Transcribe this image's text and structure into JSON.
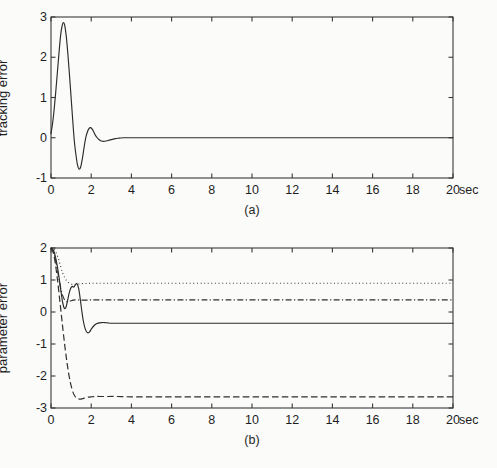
{
  "figure": {
    "background_color": "#fbfbfa",
    "ink_color": "#2b2b2b"
  },
  "chart_data": [
    {
      "type": "line",
      "panel": "a",
      "caption": "(a)",
      "title": "",
      "xlabel": "",
      "ylabel": "tracking error",
      "x_unit": "sec",
      "xlim": [
        0,
        20
      ],
      "ylim": [
        -1,
        3
      ],
      "xticks": [
        0,
        2,
        4,
        6,
        8,
        10,
        12,
        14,
        16,
        18,
        20
      ],
      "xtick_labels": [
        "0",
        "2",
        "4",
        "6",
        "8",
        "10",
        "12",
        "14",
        "16",
        "18",
        "20"
      ],
      "yticks": [
        -1,
        0,
        1,
        2,
        3
      ],
      "ytick_labels": [
        "-1",
        "0",
        "1",
        "2",
        "3"
      ],
      "grid": false,
      "legend": false,
      "box": true,
      "series": [
        {
          "name": "tracking error",
          "style": "solid",
          "x": [
            0.0,
            0.08,
            0.16,
            0.24,
            0.32,
            0.4,
            0.48,
            0.56,
            0.62,
            0.68,
            0.76,
            0.84,
            0.92,
            1.0,
            1.08,
            1.16,
            1.24,
            1.32,
            1.4,
            1.48,
            1.56,
            1.64,
            1.72,
            1.8,
            1.88,
            1.96,
            2.04,
            2.12,
            2.2,
            2.3,
            2.4,
            2.5,
            2.62,
            2.75,
            2.9,
            3.05,
            3.2,
            3.4,
            3.6,
            3.9,
            4.3,
            5.0,
            6.0,
            8.0,
            10.0,
            13.0,
            16.0,
            20.0
          ],
          "y": [
            0.1,
            0.36,
            0.72,
            1.16,
            1.64,
            2.12,
            2.55,
            2.8,
            2.86,
            2.8,
            2.52,
            2.08,
            1.56,
            1.0,
            0.44,
            -0.08,
            -0.42,
            -0.68,
            -0.78,
            -0.72,
            -0.52,
            -0.26,
            -0.02,
            0.13,
            0.22,
            0.25,
            0.22,
            0.15,
            0.07,
            0.0,
            -0.05,
            -0.08,
            -0.09,
            -0.08,
            -0.06,
            -0.04,
            -0.02,
            -0.01,
            0.0,
            0.0,
            0.0,
            0.0,
            0.0,
            0.0,
            0.0,
            0.0,
            0.0,
            0.0
          ]
        }
      ]
    },
    {
      "type": "line",
      "panel": "b",
      "caption": "(b)",
      "title": "",
      "xlabel": "",
      "ylabel": "parameter error",
      "x_unit": "sec",
      "xlim": [
        0,
        20
      ],
      "ylim": [
        -3,
        2
      ],
      "xticks": [
        0,
        2,
        4,
        6,
        8,
        10,
        12,
        14,
        16,
        18,
        20
      ],
      "xtick_labels": [
        "0",
        "2",
        "4",
        "6",
        "8",
        "10",
        "12",
        "14",
        "16",
        "18",
        "20"
      ],
      "yticks": [
        -3,
        -2,
        -1,
        0,
        1,
        2
      ],
      "ytick_labels": [
        "-3",
        "-2",
        "-1",
        "0",
        "1",
        "2"
      ],
      "grid": false,
      "legend": false,
      "box": true,
      "series": [
        {
          "name": "parameter error 1",
          "style": "solid",
          "final_value": -0.35,
          "x": [
            0.0,
            0.1,
            0.2,
            0.3,
            0.4,
            0.5,
            0.58,
            0.66,
            0.74,
            0.82,
            0.9,
            0.98,
            1.06,
            1.14,
            1.22,
            1.3,
            1.38,
            1.46,
            1.54,
            1.62,
            1.72,
            1.82,
            1.92,
            2.02,
            2.14,
            2.26,
            2.38,
            2.52,
            2.66,
            2.82,
            3.0,
            3.2,
            3.5,
            4.0,
            5.0,
            6.5,
            8.0,
            10.0,
            13.0,
            16.0,
            20.0
          ],
          "y": [
            2.0,
            1.95,
            1.78,
            1.48,
            1.08,
            0.62,
            0.3,
            0.12,
            0.14,
            0.34,
            0.58,
            0.74,
            0.8,
            0.78,
            0.86,
            0.88,
            0.72,
            0.38,
            0.0,
            -0.32,
            -0.56,
            -0.65,
            -0.62,
            -0.52,
            -0.43,
            -0.37,
            -0.34,
            -0.33,
            -0.33,
            -0.34,
            -0.35,
            -0.35,
            -0.35,
            -0.35,
            -0.35,
            -0.35,
            -0.35,
            -0.35,
            -0.35,
            -0.35,
            -0.35
          ]
        },
        {
          "name": "parameter error 2",
          "style": "dotted",
          "final_value": 0.9,
          "x": [
            0.0,
            0.12,
            0.24,
            0.36,
            0.48,
            0.58,
            0.68,
            0.78,
            0.88,
            0.98,
            1.08,
            1.18,
            1.3,
            1.45,
            1.6,
            1.8,
            2.0,
            2.3,
            2.7,
            3.2,
            4.0,
            5.5,
            7.5,
            10.0,
            13.0,
            16.0,
            20.0
          ],
          "y": [
            2.0,
            1.98,
            1.88,
            1.68,
            1.42,
            1.22,
            1.08,
            0.98,
            0.92,
            0.88,
            0.86,
            0.86,
            0.87,
            0.88,
            0.89,
            0.89,
            0.9,
            0.9,
            0.9,
            0.9,
            0.9,
            0.9,
            0.9,
            0.9,
            0.9,
            0.9,
            0.9
          ]
        },
        {
          "name": "parameter error 3",
          "style": "dashdot",
          "final_value": 0.38,
          "x": [
            0.0,
            0.1,
            0.2,
            0.3,
            0.4,
            0.5,
            0.6,
            0.7,
            0.8,
            0.9,
            1.0,
            1.1,
            1.2,
            1.32,
            1.45,
            1.6,
            1.8,
            2.0,
            2.3,
            2.7,
            3.2,
            4.0,
            5.5,
            7.5,
            10.0,
            13.0,
            16.0,
            20.0
          ],
          "y": [
            2.0,
            1.92,
            1.7,
            1.38,
            1.02,
            0.7,
            0.48,
            0.36,
            0.32,
            0.33,
            0.35,
            0.37,
            0.38,
            0.38,
            0.37,
            0.37,
            0.37,
            0.38,
            0.38,
            0.38,
            0.38,
            0.38,
            0.38,
            0.38,
            0.38,
            0.38,
            0.38,
            0.38
          ]
        },
        {
          "name": "parameter error 4",
          "style": "dashed",
          "final_value": -2.65,
          "x": [
            0.0,
            0.1,
            0.2,
            0.3,
            0.4,
            0.5,
            0.6,
            0.7,
            0.8,
            0.9,
            1.0,
            1.1,
            1.2,
            1.3,
            1.4,
            1.5,
            1.62,
            1.74,
            1.86,
            2.0,
            2.2,
            2.45,
            2.8,
            3.3,
            4.0,
            5.5,
            7.5,
            10.0,
            13.0,
            16.0,
            20.0
          ],
          "y": [
            2.0,
            1.88,
            1.58,
            1.12,
            0.58,
            0.0,
            -0.58,
            -1.12,
            -1.6,
            -2.0,
            -2.3,
            -2.52,
            -2.64,
            -2.7,
            -2.72,
            -2.72,
            -2.7,
            -2.68,
            -2.66,
            -2.65,
            -2.64,
            -2.64,
            -2.64,
            -2.64,
            -2.65,
            -2.65,
            -2.65,
            -2.65,
            -2.65,
            -2.65,
            -2.65
          ]
        }
      ]
    }
  ]
}
